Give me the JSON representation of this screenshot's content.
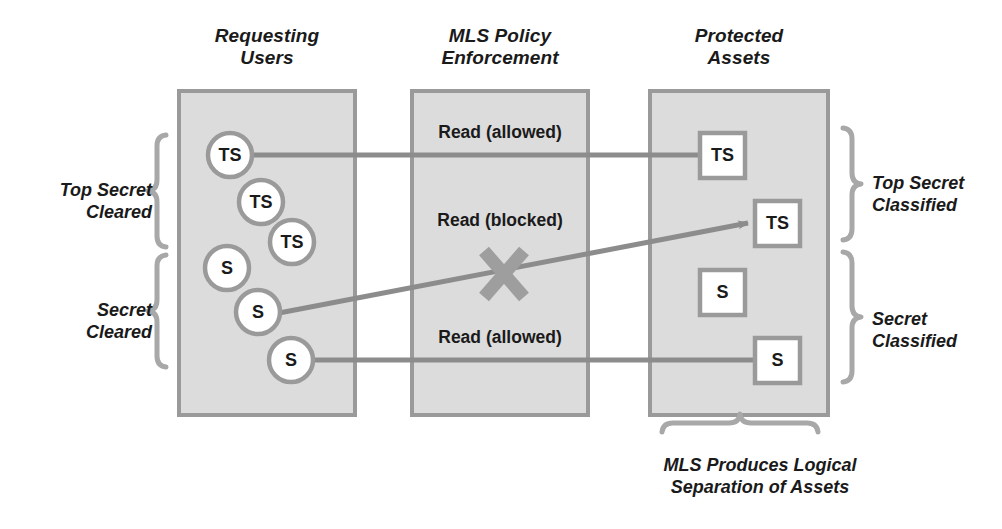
{
  "diagram": {
    "title_columns": [
      {
        "id": "requesting-users",
        "line1": "Requesting",
        "line2": "Users"
      },
      {
        "id": "mls-policy-enforcement",
        "line1": "MLS Policy",
        "line2": "Enforcement"
      },
      {
        "id": "protected-assets",
        "line1": "Protected",
        "line2": "Assets"
      }
    ],
    "left_group_labels": [
      {
        "id": "top-secret-cleared",
        "line1": "Top Secret",
        "line2": "Cleared"
      },
      {
        "id": "secret-cleared",
        "line1": "Secret",
        "line2": "Cleared"
      }
    ],
    "right_group_labels": [
      {
        "id": "top-secret-classified",
        "line1": "Top Secret",
        "line2": "Classified"
      },
      {
        "id": "secret-classified",
        "line1": "Secret",
        "line2": "Classified"
      }
    ],
    "policy_labels": [
      {
        "id": "read-allowed-top",
        "text": "Read (allowed)"
      },
      {
        "id": "read-blocked",
        "text": "Read (blocked)"
      },
      {
        "id": "read-allowed-bottom",
        "text": "Read (allowed)"
      }
    ],
    "users": [
      {
        "id": "user-ts-1",
        "label": "TS",
        "cx": 230,
        "cy": 155,
        "r": 22
      },
      {
        "id": "user-ts-2",
        "label": "TS",
        "cx": 261,
        "cy": 202,
        "r": 22
      },
      {
        "id": "user-ts-3",
        "label": "TS",
        "cx": 292,
        "cy": 242,
        "r": 22
      },
      {
        "id": "user-s-1",
        "label": "S",
        "cx": 227,
        "cy": 268,
        "r": 22
      },
      {
        "id": "user-s-2",
        "label": "S",
        "cx": 258,
        "cy": 312,
        "r": 22
      },
      {
        "id": "user-s-3",
        "label": "S",
        "cx": 291,
        "cy": 360,
        "r": 22
      }
    ],
    "assets": [
      {
        "id": "asset-ts-1",
        "label": "TS",
        "x": 700,
        "y": 133,
        "w": 45,
        "h": 45
      },
      {
        "id": "asset-ts-2",
        "label": "TS",
        "x": 755,
        "y": 201,
        "w": 45,
        "h": 45
      },
      {
        "id": "asset-s-1",
        "label": "S",
        "x": 700,
        "y": 270,
        "w": 45,
        "h": 45
      },
      {
        "id": "asset-s-2",
        "label": "S",
        "x": 755,
        "y": 338,
        "w": 45,
        "h": 45
      }
    ],
    "caption": {
      "line1": "MLS Produces Logical",
      "line2": "Separation of Assets"
    },
    "blocked_marker": "x-cross-icon",
    "colors": {
      "panel_fill": "#dcdcdc",
      "panel_border": "#9a9a9a",
      "line": "#8c8c8c",
      "node_fill": "#ffffff",
      "node_border": "#9a9a9a",
      "text": "#1a1a1a",
      "brace": "#a8a8a8"
    }
  }
}
